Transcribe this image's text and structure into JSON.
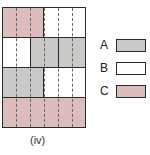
{
  "colors": {
    "A": "#c9cac8",
    "B": "#ffffff",
    "C": "#dcbcbc"
  },
  "grid": {
    "rows": [
      {
        "cells": [
          {
            "span": "1/2",
            "fill": "C"
          },
          {
            "span": "1/2",
            "fill": "B"
          }
        ]
      },
      {
        "cells": [
          {
            "span": "1/3",
            "fill": "B"
          },
          {
            "span": "1/3",
            "fill": "A"
          },
          {
            "span": "1/3",
            "fill": "A"
          }
        ]
      },
      {
        "cells": [
          {
            "span": "1/2",
            "fill": "A"
          },
          {
            "span": "1/2",
            "fill": "B"
          }
        ]
      },
      {
        "cells": [
          {
            "span": "1",
            "fill": "C"
          }
        ]
      }
    ],
    "dashed_divisions": 6
  },
  "legend": {
    "items": [
      {
        "label": "A",
        "fill": "A"
      },
      {
        "label": "B",
        "fill": "B"
      },
      {
        "label": "C",
        "fill": "C"
      }
    ]
  },
  "caption": "(iv)"
}
